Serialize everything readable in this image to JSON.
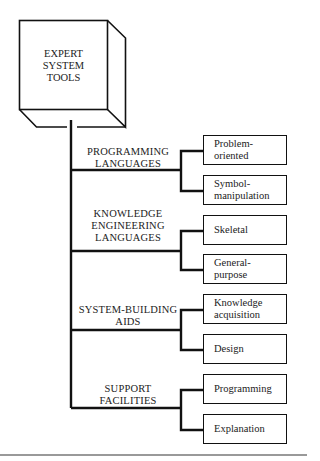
{
  "root": {
    "label": "EXPERT\nSYSTEM\nTOOLS"
  },
  "categories": [
    {
      "label": "PROGRAMMING\nLANGUAGES",
      "children": [
        "Problem-\noriented",
        "Symbol-\nmanipulation"
      ]
    },
    {
      "label": "KNOWLEDGE\nENGINEERING\nLANGUAGES",
      "children": [
        "Skeletal",
        "General-\npurpose"
      ]
    },
    {
      "label": "SYSTEM-BUILDING\nAIDS",
      "children": [
        "Knowledge\nacquisition",
        "Design"
      ]
    },
    {
      "label": "SUPPORT\nFACILITIES",
      "children": [
        "Programming",
        "Explanation"
      ]
    }
  ]
}
